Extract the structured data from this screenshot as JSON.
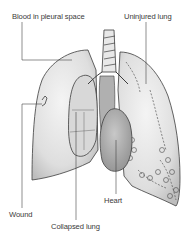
{
  "diagram": {
    "labels": {
      "blood": "Blood in pleural space",
      "uninjured": "Uninjured lung",
      "wound": "Wound",
      "heart": "Heart",
      "collapsed": "Collapsed lung"
    },
    "colors": {
      "background": "#ffffff",
      "outline": "#3c3c3c",
      "lung_fill": "#e4e4e4",
      "shadow": "#b8b8b8",
      "heart_fill": "#a9a9a9",
      "label_text": "#3a3a3a"
    }
  }
}
